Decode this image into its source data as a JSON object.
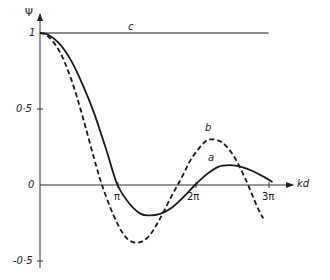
{
  "chart_data": {
    "type": "line",
    "title": "",
    "xlabel": "kd",
    "ylabel": "Ψ",
    "xlim": [
      0,
      3.15
    ],
    "ylim": [
      -0.55,
      1.1
    ],
    "x_unit": "π",
    "x_ticks": [
      {
        "value": 1,
        "label": "π"
      },
      {
        "value": 2,
        "label": "2π"
      },
      {
        "value": 3,
        "label": "3π"
      }
    ],
    "y_ticks": [
      {
        "value": 1,
        "label": "1"
      },
      {
        "value": 0.5,
        "label": "0·5"
      },
      {
        "value": 0,
        "label": "0"
      },
      {
        "value": -0.5,
        "label": "-0·5"
      }
    ],
    "grid": false,
    "legend": "inline curve labels",
    "series": [
      {
        "name": "a",
        "style": "solid",
        "x": [
          0,
          0.1,
          0.25,
          0.4,
          0.55,
          0.7,
          0.85,
          1.0,
          1.15,
          1.3,
          1.42,
          1.55,
          1.7,
          1.85,
          2.0,
          2.15,
          2.3,
          2.45,
          2.6,
          2.75,
          2.9,
          3.0
        ],
        "y": [
          1.0,
          0.99,
          0.93,
          0.82,
          0.66,
          0.47,
          0.24,
          0.0,
          -0.12,
          -0.19,
          -0.2,
          -0.19,
          -0.15,
          -0.08,
          0.0,
          0.07,
          0.12,
          0.13,
          0.12,
          0.09,
          0.05,
          0.02
        ]
      },
      {
        "name": "b",
        "style": "dashed",
        "x": [
          0,
          0.1,
          0.25,
          0.4,
          0.55,
          0.7,
          0.8,
          0.95,
          1.1,
          1.25,
          1.4,
          1.55,
          1.7,
          1.83,
          1.95,
          2.1,
          2.2,
          2.35,
          2.5,
          2.65,
          2.8,
          2.88
        ],
        "y": [
          1.0,
          0.98,
          0.88,
          0.7,
          0.45,
          0.17,
          0.0,
          -0.2,
          -0.34,
          -0.38,
          -0.34,
          -0.22,
          -0.07,
          0.05,
          0.17,
          0.27,
          0.3,
          0.28,
          0.19,
          0.04,
          -0.14,
          -0.22
        ]
      },
      {
        "name": "c",
        "style": "solid",
        "x": [
          0,
          2.95
        ],
        "y": [
          1.0,
          1.0
        ]
      }
    ],
    "annotations": [
      {
        "text": "a",
        "x": 2.3,
        "y": 0.2
      },
      {
        "text": "b",
        "x": 2.1,
        "y": 0.38
      },
      {
        "text": "c",
        "x": 1.18,
        "y": 1.04
      }
    ]
  },
  "labels": {
    "y_axis": "Ψ",
    "x_axis": "kd",
    "curve_a": "a",
    "curve_b": "b",
    "curve_c": "c",
    "tick_pi": "π",
    "tick_2pi": "2π",
    "tick_3pi": "3π",
    "tick_y1": "1",
    "tick_y05": "0·5",
    "tick_y0": "0",
    "tick_ym05": "-0·5"
  }
}
